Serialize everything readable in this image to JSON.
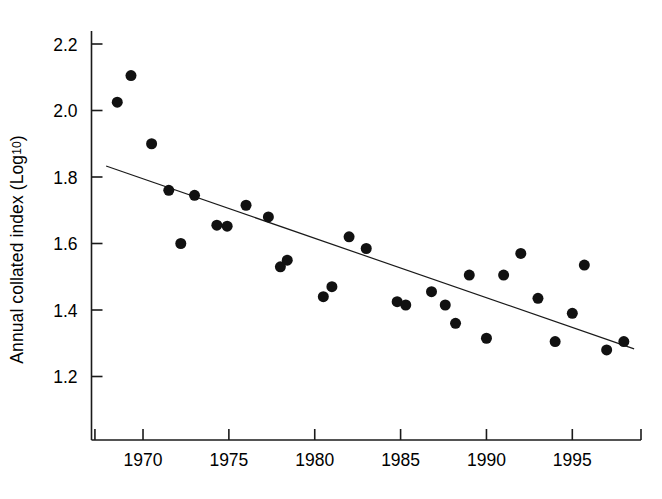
{
  "figure": {
    "background": "#ffffff",
    "ink_color": "#111111",
    "axis_color": "#1a1a1a"
  },
  "axis_label": {
    "y_main": "Annual collated index (Log",
    "y_sub": "10",
    "y_tail": ")"
  },
  "chart_data": {
    "type": "scatter",
    "title": "",
    "subtitle": "",
    "xlabel": "",
    "ylabel": "Annual collated index (Log10)",
    "xlim": [
      1967.0,
      1999.0
    ],
    "ylim": [
      1.09,
      2.28
    ],
    "grid": false,
    "legend": null,
    "xticks": [
      1970,
      1975,
      1980,
      1985,
      1990,
      1995
    ],
    "xtick_labels": [
      "1970",
      "1975",
      "1980",
      "1985",
      "1990",
      "1995"
    ],
    "x_extra_ticks": [
      1967.2,
      1999.0
    ],
    "yticks": [
      1.2,
      1.4,
      1.6,
      1.8,
      2.0,
      2.2
    ],
    "ytick_labels": [
      "1.2",
      "1.4",
      "1.6",
      "1.8",
      "2.0",
      "2.2"
    ],
    "marker": {
      "shape": "circle",
      "color": "#111111",
      "size_px": 11
    },
    "series": [
      {
        "name": "Annual collated index",
        "x": [
          1968.5,
          1969.3,
          1970.5,
          1971.5,
          1972.2,
          1973.0,
          1974.3,
          1974.9,
          1976.0,
          1977.3,
          1978.0,
          1978.4,
          1980.5,
          1981.0,
          1982.0,
          1983.0,
          1984.8,
          1985.3,
          1986.8,
          1987.6,
          1988.2,
          1989.0,
          1990.0,
          1991.0,
          1992.0,
          1993.0,
          1994.0,
          1995.0,
          1995.7,
          1997.0,
          1998.0
        ],
        "y": [
          2.025,
          2.105,
          1.9,
          1.76,
          1.6,
          1.745,
          1.655,
          1.652,
          1.715,
          1.68,
          1.53,
          1.55,
          1.44,
          1.47,
          1.62,
          1.585,
          1.425,
          1.415,
          1.455,
          1.415,
          1.36,
          1.505,
          1.315,
          1.505,
          1.57,
          1.435,
          1.305,
          1.39,
          1.535,
          1.28,
          1.305
        ]
      }
    ],
    "trendline": {
      "type": "linear-regression",
      "x_start": 1967.85,
      "y_start": 1.833,
      "x_end": 1998.6,
      "y_end": 1.283,
      "color": "#1a1a1a",
      "width_px": 1.2
    }
  }
}
